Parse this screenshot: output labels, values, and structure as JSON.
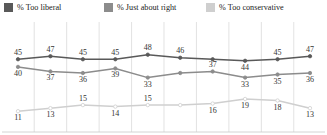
{
  "legend": {
    "items": [
      {
        "label": "% Too liberal",
        "color": "#595959",
        "icon": "square-swatch-icon"
      },
      {
        "label": "% Just about right",
        "color": "#8c8c8c",
        "icon": "square-swatch-icon"
      },
      {
        "label": "% Too conservative",
        "color": "#cfcfcf",
        "icon": "square-swatch-icon"
      }
    ]
  },
  "chart_data": {
    "type": "line",
    "title": "",
    "xlabel": "",
    "ylabel": "",
    "ylim": [
      0,
      55
    ],
    "grid": "vertical",
    "legend_position": "top",
    "x": [
      1,
      2,
      3,
      4,
      5,
      6,
      7,
      8,
      9,
      10
    ],
    "categories": [
      "",
      "",
      "",
      "",
      "",
      "",
      "",
      "",
      "",
      ""
    ],
    "series": [
      {
        "name": "% Too liberal",
        "color": "#595959",
        "values": [
          45,
          47,
          45,
          45,
          48,
          46,
          45,
          44,
          45,
          47
        ],
        "labels": [
          "45",
          "47",
          "45",
          "45",
          "48",
          "46",
          "",
          "44",
          "45",
          "47"
        ],
        "label_pos": [
          "above",
          "above",
          "above",
          "above",
          "above",
          "above",
          "",
          "below",
          "above",
          "above"
        ]
      },
      {
        "name": "% Just about right",
        "color": "#8c8c8c",
        "values": [
          40,
          37,
          36,
          39,
          33,
          36,
          37,
          33,
          35,
          36
        ],
        "labels": [
          "40",
          "37",
          "36",
          "39",
          "33",
          "",
          "37",
          "33",
          "35",
          "36"
        ],
        "label_pos": [
          "below",
          "below",
          "below",
          "below",
          "below",
          "",
          "above",
          "below",
          "below",
          "below"
        ]
      },
      {
        "name": "% Too conservative",
        "color": "#cfcfcf",
        "values": [
          11,
          13,
          15,
          14,
          15,
          15,
          16,
          19,
          18,
          13
        ],
        "labels": [
          "11",
          "13",
          "15",
          "14",
          "15",
          "",
          "16",
          "19",
          "18",
          "13"
        ],
        "label_pos": [
          "below",
          "below",
          "above",
          "below",
          "above",
          "",
          "below",
          "below",
          "below",
          "below"
        ]
      }
    ]
  }
}
